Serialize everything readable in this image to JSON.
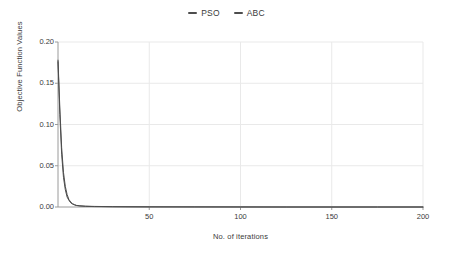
{
  "caption_remnant": " ",
  "legend": {
    "position": "top-center",
    "entries": [
      {
        "label": "PSO",
        "color": "#4d4d4d"
      },
      {
        "label": "ABC",
        "color": "#4d4d4d"
      }
    ]
  },
  "axes": {
    "ylabel": "Objective Function Values",
    "xlabel": "No. of iterations",
    "yticks": [
      "0.00",
      "0.05",
      "0.10",
      "0.15",
      "0.20"
    ],
    "xticks": [
      "50",
      "100",
      "150",
      "200"
    ]
  },
  "chart_data": {
    "type": "line",
    "title": "",
    "subtitle": "",
    "xlabel": "No. of iterations",
    "ylabel": "Objective Function Values",
    "xlim": [
      0,
      200
    ],
    "ylim": [
      0.0,
      0.2
    ],
    "xticks": [
      50,
      100,
      150,
      200
    ],
    "yticks": [
      0.0,
      0.05,
      0.1,
      0.15,
      0.2
    ],
    "grid": true,
    "grid_color": "#e9e9e9",
    "legend_position": "top-center",
    "series": [
      {
        "name": "PSO",
        "color": "#4d4d4d",
        "x": [
          0,
          1,
          2,
          3,
          4,
          5,
          6,
          7,
          8,
          9,
          10,
          12,
          15,
          20,
          30,
          40,
          50,
          75,
          100,
          125,
          150,
          175,
          200
        ],
        "values": [
          0.178,
          0.12,
          0.072,
          0.042,
          0.025,
          0.015,
          0.009,
          0.006,
          0.004,
          0.003,
          0.002,
          0.0015,
          0.001,
          0.0007,
          0.0004,
          0.0003,
          0.0002,
          0.0001,
          0.0001,
          0.0,
          0.0,
          0.0,
          0.0
        ]
      },
      {
        "name": "ABC",
        "color": "#4d4d4d",
        "x": [
          0,
          1,
          2,
          3,
          4,
          5,
          6,
          7,
          8,
          9,
          10,
          12,
          15,
          20,
          30,
          40,
          50,
          75,
          100,
          125,
          150,
          175,
          200
        ],
        "values": [
          0.176,
          0.112,
          0.064,
          0.036,
          0.021,
          0.012,
          0.008,
          0.005,
          0.0035,
          0.0025,
          0.0018,
          0.0012,
          0.0008,
          0.0005,
          0.0003,
          0.0002,
          0.00015,
          0.0001,
          0.0,
          0.0,
          0.0,
          0.0,
          0.0
        ]
      }
    ]
  }
}
